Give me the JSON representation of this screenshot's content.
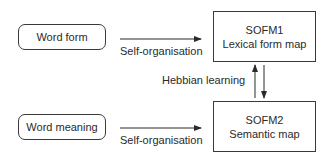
{
  "diagram": {
    "inputs": [
      {
        "id": "word-form",
        "label": "Word form"
      },
      {
        "id": "word-meaning",
        "label": "Word meaning"
      }
    ],
    "maps": [
      {
        "id": "sofm1",
        "title": "SOFM1",
        "subtitle": "Lexical form map"
      },
      {
        "id": "sofm2",
        "title": "SOFM2",
        "subtitle": "Semantic map"
      }
    ],
    "edges": [
      {
        "from": "word-form",
        "to": "sofm1",
        "label": "Self-organisation"
      },
      {
        "from": "word-meaning",
        "to": "sofm2",
        "label": "Self-organisation"
      },
      {
        "from": "sofm1",
        "to": "sofm2",
        "label": "Hebbian learning",
        "bidirectional": true
      }
    ],
    "colors": {
      "stroke": "#3a3a3a",
      "text": "#2a2a2a",
      "background": "#ffffff"
    }
  }
}
